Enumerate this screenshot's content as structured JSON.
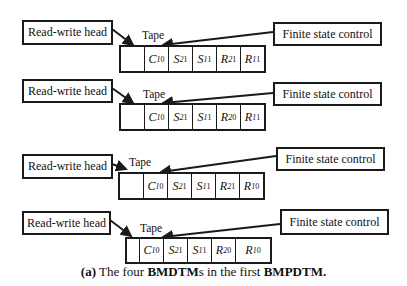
{
  "caption": {
    "prefix": "(a)",
    "text_1": " The four ",
    "bold_1": "BMDTM",
    "text_2": "s in the first ",
    "bold_2": "BMPDTM",
    "suffix": "."
  },
  "machines": [
    {
      "head_label": "Read-write head",
      "tape_label": "Tape",
      "control_label": "Finite state control",
      "cells": [
        {
          "sym": "",
          "sub": "",
          "sup": ""
        },
        {
          "sym": "C",
          "sub": "1",
          "sup": "0"
        },
        {
          "sym": "S",
          "sub": "2",
          "sup": "1"
        },
        {
          "sym": "S",
          "sub": "1",
          "sup": "1"
        },
        {
          "sym": "R",
          "sub": "2",
          "sup": "1"
        },
        {
          "sym": "R",
          "sub": "1",
          "sup": "1"
        }
      ]
    },
    {
      "head_label": "Read-write head",
      "tape_label": "Tape",
      "control_label": "Finite state control",
      "cells": [
        {
          "sym": "",
          "sub": "",
          "sup": ""
        },
        {
          "sym": "C",
          "sub": "1",
          "sup": "0"
        },
        {
          "sym": "S",
          "sub": "2",
          "sup": "1"
        },
        {
          "sym": "S",
          "sub": "1",
          "sup": "1"
        },
        {
          "sym": "R",
          "sub": "2",
          "sup": "0"
        },
        {
          "sym": "R",
          "sub": "1",
          "sup": "1"
        }
      ]
    },
    {
      "head_label": "Read-write head",
      "tape_label": "Tape",
      "control_label": "Finite state control",
      "cells": [
        {
          "sym": "",
          "sub": "",
          "sup": ""
        },
        {
          "sym": "C",
          "sub": "1",
          "sup": "0"
        },
        {
          "sym": "S",
          "sub": "2",
          "sup": "1"
        },
        {
          "sym": "S",
          "sub": "1",
          "sup": "1"
        },
        {
          "sym": "R",
          "sub": "2",
          "sup": "1"
        },
        {
          "sym": "R",
          "sub": "1",
          "sup": "0"
        }
      ]
    },
    {
      "head_label": "Read-write head",
      "tape_label": "Tape",
      "control_label": "Finite state control",
      "cells": [
        {
          "sym": "",
          "sub": "",
          "sup": ""
        },
        {
          "sym": "C",
          "sub": "1",
          "sup": "0"
        },
        {
          "sym": "S",
          "sub": "2",
          "sup": "1"
        },
        {
          "sym": "S",
          "sub": "1",
          "sup": "1"
        },
        {
          "sym": "R",
          "sub": "2",
          "sup": "0"
        },
        {
          "sym": "R",
          "sub": "1",
          "sup": "0"
        }
      ]
    }
  ]
}
